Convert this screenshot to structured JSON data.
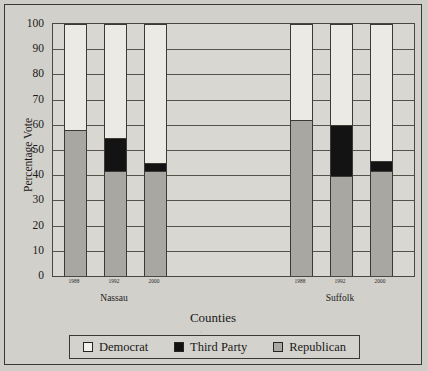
{
  "chart_data": {
    "type": "bar",
    "subtype": "stacked-bar",
    "title": "",
    "xlabel": "Counties",
    "ylabel": "Percentage Vote",
    "ylim": [
      0,
      100
    ],
    "ytick_step": 10,
    "grid": true,
    "legend_position": "bottom",
    "categories": [
      "1988",
      "1992",
      "2000",
      "1988",
      "1992",
      "2000"
    ],
    "groups": [
      {
        "name": "Nassau",
        "categories": [
          "1988",
          "1992",
          "2000"
        ]
      },
      {
        "name": "Suffolk",
        "categories": [
          "1988",
          "1992",
          "2000"
        ]
      }
    ],
    "series": [
      {
        "name": "Democrat",
        "color": "#eceae4",
        "values": [
          42,
          45,
          55,
          38,
          40,
          54
        ]
      },
      {
        "name": "Third Party",
        "color": "#131313",
        "values": [
          0,
          13,
          3,
          0,
          20,
          4
        ]
      },
      {
        "name": "Republican",
        "color": "#a9a7a1",
        "values": [
          58,
          42,
          42,
          62,
          40,
          42
        ]
      }
    ],
    "bars": [
      {
        "group": "Nassau",
        "year": "1988",
        "democrat": 42,
        "third_party": 0,
        "republican": 58,
        "total": 100
      },
      {
        "group": "Nassau",
        "year": "1992",
        "democrat": 45,
        "third_party": 13,
        "republican": 42,
        "total": 100
      },
      {
        "group": "Nassau",
        "year": "2000",
        "democrat": 55,
        "third_party": 3,
        "republican": 42,
        "total": 100
      },
      {
        "group": "Suffolk",
        "year": "1988",
        "democrat": 38,
        "third_party": 0,
        "republican": 62,
        "total": 100
      },
      {
        "group": "Suffolk",
        "year": "1992",
        "democrat": 40,
        "third_party": 20,
        "republican": 40,
        "total": 100
      },
      {
        "group": "Suffolk",
        "year": "2000",
        "democrat": 54,
        "third_party": 4,
        "republican": 42,
        "total": 100
      }
    ],
    "ytick_labels": [
      "0",
      "10",
      "20",
      "30",
      "40",
      "50",
      "60",
      "70",
      "80",
      "90",
      "100"
    ]
  },
  "axes": {
    "y_title": "Percentage Vote",
    "x_title": "Counties",
    "y_ticks": [
      "100",
      "90",
      "80",
      "70",
      "60",
      "50",
      "40",
      "30",
      "20",
      "10",
      "0"
    ],
    "x_ticks": [
      "1988",
      "1992",
      "2000",
      "1988",
      "1992",
      "2000"
    ],
    "group_labels": [
      "Nassau",
      "Suffolk"
    ]
  },
  "legend": {
    "items": [
      {
        "label": "Democrat",
        "color": "#f2f0ea"
      },
      {
        "label": "Third Party",
        "color": "#111111"
      },
      {
        "label": "Republican",
        "color": "#aaa8a2"
      }
    ]
  },
  "colors": {
    "page_background": "#cfcdc7",
    "plot_background": "#d9d7d1",
    "frame": "#3a3833",
    "gridline": "#56534d",
    "democrat": "#eceae4",
    "third_party": "#131313",
    "republican": "#a9a7a1"
  }
}
